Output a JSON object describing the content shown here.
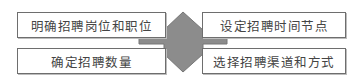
{
  "diagram": {
    "center_shape": {
      "fill": "#8c8c8c",
      "stroke": "#7a7a7a"
    },
    "boxes": [
      {
        "position": "top-left",
        "label": "明确招聘岗位和职位"
      },
      {
        "position": "bottom-left",
        "label": "确定招聘数量"
      },
      {
        "position": "top-right",
        "label": "设定招聘时间节点"
      },
      {
        "position": "bottom-right",
        "label": "选择招聘渠道和方式"
      }
    ]
  }
}
